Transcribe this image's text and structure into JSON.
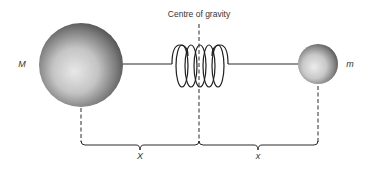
{
  "diagram": {
    "title_label": "Centre of gravity",
    "masses": [
      {
        "id": "large",
        "label": "M",
        "cx": 81,
        "cy": 65,
        "r": 42
      },
      {
        "id": "small",
        "label": "m",
        "cx": 318,
        "cy": 64,
        "r": 20
      }
    ],
    "distances": [
      {
        "label": "X",
        "from": 81,
        "to": 199
      },
      {
        "label": "x",
        "from": 199,
        "to": 318
      }
    ],
    "centre_line_x": 199,
    "colors": {
      "line": "#2a2a2a",
      "sphere_light": "#e6e6e6",
      "sphere_dark": "#4a4a4a",
      "text": "#333333"
    }
  }
}
